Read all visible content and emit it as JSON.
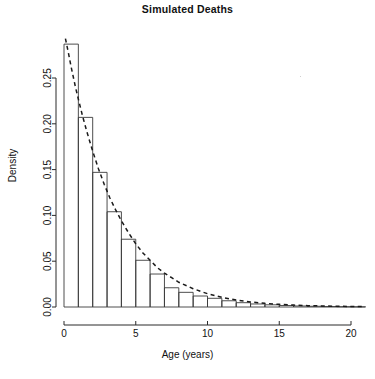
{
  "chart_data": {
    "type": "bar",
    "title": "Simulated Deaths",
    "xlabel": "Age (years)",
    "ylabel": "Density",
    "grid": false,
    "legend": false,
    "xlim": [
      0,
      21
    ],
    "ylim": [
      0,
      0.29
    ],
    "xticks": [
      0,
      5,
      10,
      15,
      20
    ],
    "xtick_labels": [
      "0",
      "5",
      "10",
      "15",
      "20"
    ],
    "yticks": [
      0.0,
      0.05,
      0.1,
      0.15,
      0.2,
      0.25
    ],
    "ytick_labels": [
      "0.00",
      "0.05",
      "0.10",
      "0.15",
      "0.20",
      "0.25"
    ],
    "bin_width": 1,
    "bin_edges": [
      0,
      1,
      2,
      3,
      4,
      5,
      6,
      7,
      8,
      9,
      10,
      11,
      12,
      13,
      14,
      15,
      16,
      17,
      18,
      19,
      20,
      21
    ],
    "categories": [
      "0-1",
      "1-2",
      "2-3",
      "3-4",
      "4-5",
      "5-6",
      "6-7",
      "7-8",
      "8-9",
      "9-10",
      "10-11",
      "11-12",
      "12-13",
      "13-14",
      "14-15",
      "15-16",
      "16-17",
      "17-18",
      "18-19",
      "19-20",
      "20-21"
    ],
    "values": [
      0.287,
      0.207,
      0.147,
      0.104,
      0.074,
      0.051,
      0.036,
      0.021,
      0.016,
      0.012,
      0.0095,
      0.0068,
      0.0047,
      0.0033,
      0.0024,
      0.0016,
      0.0011,
      0.0008,
      0.0005,
      0.0003,
      0.0002
    ],
    "series": [
      {
        "name": "Density curve",
        "style": "dashed",
        "type": "line",
        "x": [
          0.1,
          0.3,
          0.5,
          0.8,
          1.0,
          1.3,
          1.6,
          2.0,
          2.4,
          2.8,
          3.2,
          3.6,
          4.0,
          4.5,
          5.0,
          5.5,
          6.0,
          6.5,
          7.0,
          7.5,
          8.0,
          9.0,
          10.0,
          11.0,
          12.0,
          13.0,
          14.0,
          15.0,
          16.0,
          17.0,
          18.0,
          19.0,
          20.0,
          21.0
        ],
        "y": [
          0.293,
          0.278,
          0.262,
          0.24,
          0.227,
          0.208,
          0.191,
          0.17,
          0.151,
          0.134,
          0.119,
          0.106,
          0.094,
          0.081,
          0.069,
          0.059,
          0.051,
          0.043,
          0.037,
          0.032,
          0.027,
          0.02,
          0.0145,
          0.0105,
          0.0076,
          0.0055,
          0.004,
          0.0029,
          0.0021,
          0.0015,
          0.0011,
          0.0008,
          0.0006,
          0.0004
        ]
      }
    ]
  }
}
